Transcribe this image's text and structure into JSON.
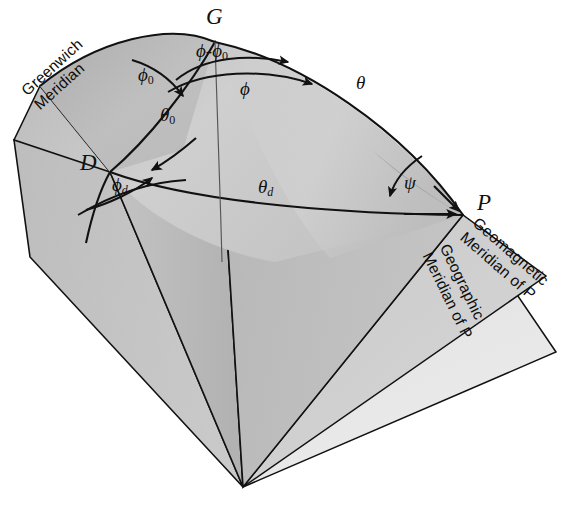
{
  "figure": {
    "type": "geometry-diagram",
    "background": "#ffffff",
    "stroke_color": "#111111",
    "palette": {
      "sphere_light": "#d2d2d2",
      "sphere_mid": "#bdbdbd",
      "sphere_dark": "#a8a8a8",
      "wedge_light": "#c6c6c6",
      "wedge_mid": "#b4b4b4",
      "wedge_dark": "#a2a2a2",
      "panel_pale": "#dcdcdc",
      "panel_palest": "#e6e6e6"
    }
  },
  "vertices": [
    {
      "id": "G",
      "label": "G",
      "x": 215,
      "y": 42,
      "desc": "geographic-north-pole"
    },
    {
      "id": "D",
      "label": "D",
      "x": 110,
      "y": 172,
      "desc": "geomagnetic-pole"
    },
    {
      "id": "P",
      "label": "P",
      "x": 463,
      "y": 215,
      "desc": "observation-point"
    },
    {
      "id": "O",
      "label": "",
      "x": 243,
      "y": 487,
      "desc": "sphere-center-apex"
    }
  ],
  "point_labels": [
    {
      "name": "point-label-G",
      "text": "G",
      "x": 206,
      "y": 6
    },
    {
      "name": "point-label-D",
      "text": "D",
      "x": 83,
      "y": 153
    },
    {
      "name": "point-label-P",
      "text": "P",
      "x": 477,
      "y": 191
    }
  ],
  "angle_labels": [
    {
      "name": "angle-phi-minus-phi0",
      "base": "ϕ-ϕ",
      "sub": "0",
      "x": 215,
      "y": 41,
      "vertex": "G",
      "desc": "longitude difference at G"
    },
    {
      "name": "angle-phi",
      "base": "ϕ",
      "sub": "",
      "x": 241,
      "y": 72,
      "vertex": "G",
      "desc": "geographic longitude of P"
    },
    {
      "name": "angle-phi0",
      "base": "ϕ",
      "sub": "0",
      "x": 143,
      "y": 67,
      "vertex": "G",
      "desc": "longitude of geomagnetic pole"
    },
    {
      "name": "angle-phi-d",
      "base": "ϕ",
      "sub": "d",
      "x": 117,
      "y": 178,
      "vertex": "D",
      "desc": "azimuth at geomagnetic pole"
    },
    {
      "name": "angle-psi",
      "base": "ψ",
      "sub": "",
      "x": 408,
      "y": 176,
      "vertex": "P",
      "desc": "declination angle at P"
    },
    {
      "name": "arc-theta0",
      "base": "θ",
      "sub": "0",
      "x": 165,
      "y": 108,
      "vertex": "",
      "desc": "colatitude of geomagnetic pole"
    },
    {
      "name": "arc-theta",
      "base": "θ",
      "sub": "",
      "x": 357,
      "y": 74,
      "vertex": "",
      "desc": "geographic colatitude of P"
    },
    {
      "name": "arc-theta-d",
      "base": "θ",
      "sub": "d",
      "x": 262,
      "y": 178,
      "vertex": "",
      "desc": "geomagnetic colatitude of P"
    }
  ],
  "plane_labels": [
    {
      "name": "greenwich-meridian-label",
      "line1": "Greenwich",
      "line2": "Meridian",
      "x": 18,
      "y": 88,
      "rotate": -42
    },
    {
      "name": "geomagnetic-meridian-label",
      "line1": "Geomagnetic",
      "line2": "Meridian of P",
      "x": 480,
      "y": 216,
      "rotate": 41
    },
    {
      "name": "geographic-meridian-label",
      "line1": "Geographic",
      "line2": "Meridian of P",
      "x": 450,
      "y": 243,
      "rotate": 64
    }
  ]
}
